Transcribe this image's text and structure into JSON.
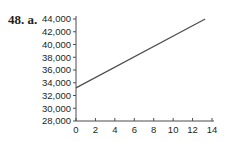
{
  "problem_label": "48. a.",
  "chart_data": {
    "type": "line",
    "title": "",
    "xlabel": "",
    "ylabel": "",
    "xlim": [
      0,
      14
    ],
    "ylim": [
      28000,
      44000
    ],
    "x_ticks": [
      0,
      2,
      4,
      6,
      8,
      10,
      12,
      14
    ],
    "x_tick_labels": [
      "0",
      "2",
      "4",
      "6",
      "8",
      "10",
      "12",
      "14"
    ],
    "y_ticks": [
      28000,
      30000,
      32000,
      34000,
      36000,
      38000,
      40000,
      42000,
      44000
    ],
    "y_tick_labels": [
      "28,000",
      "30,000",
      "32,000",
      "34,000",
      "36,000",
      "38,000",
      "40,000",
      "42,000",
      "44,000"
    ],
    "grid": false,
    "legend": null,
    "series": [
      {
        "name": "line",
        "x": [
          0,
          13.3
        ],
        "y": [
          33200,
          44000
        ],
        "color": "#4d4d4f"
      }
    ]
  }
}
